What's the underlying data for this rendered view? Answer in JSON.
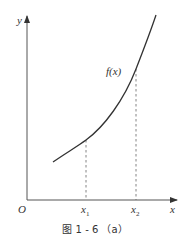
{
  "diagram": {
    "axes": {
      "y_label": "y",
      "x_label": "x",
      "origin_label": "O"
    },
    "curve": {
      "label": "f(x)",
      "color": "#333333"
    },
    "markers": [
      {
        "label": "x",
        "subscript": "1"
      },
      {
        "label": "x",
        "subscript": "2"
      }
    ],
    "caption": "图 1 - 6 （a）"
  }
}
